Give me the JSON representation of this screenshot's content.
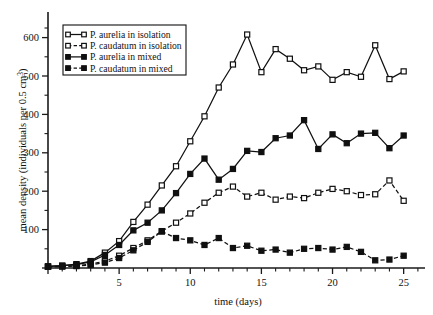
{
  "chart_data": {
    "type": "line",
    "title": "",
    "xlabel": "time (days)",
    "ylabel": "mean density (individuals per 0.5 cm",
    "ylabel_exponent": "3",
    "ylabel_suffix": ")",
    "xlim": [
      0,
      26.5
    ],
    "ylim": [
      0,
      625
    ],
    "grid": false,
    "legend_position": "upper-left",
    "xticks": [
      0,
      5,
      10,
      15,
      20,
      25
    ],
    "xtick_labels": [
      "",
      "5",
      "10",
      "15",
      "20",
      "25"
    ],
    "xticks_minor": [
      1,
      2,
      3,
      4,
      6,
      7,
      8,
      9,
      11,
      12,
      13,
      14,
      16,
      17,
      18,
      19,
      21,
      22,
      23,
      24,
      26
    ],
    "yticks": [
      0,
      100,
      200,
      300,
      400,
      500,
      600
    ],
    "ytick_labels": [
      "",
      "100",
      "200",
      "300",
      "400",
      "500",
      "600"
    ],
    "yticks_minor": [
      50,
      150,
      250,
      350,
      450,
      550,
      625
    ],
    "x": [
      0,
      1,
      2,
      3,
      4,
      5,
      6,
      7,
      8,
      9,
      10,
      11,
      12,
      13,
      14,
      15,
      16,
      17,
      18,
      19,
      20,
      21,
      22,
      23,
      24,
      25
    ],
    "series": [
      {
        "name": "P. aurelia in isolation",
        "marker": "open-square",
        "linestyle": "solid",
        "color": "#101010",
        "values": [
          4,
          6,
          10,
          18,
          40,
          70,
          120,
          165,
          215,
          265,
          330,
          395,
          470,
          530,
          608,
          510,
          570,
          545,
          515,
          525,
          490,
          510,
          498,
          580,
          492,
          512
        ]
      },
      {
        "name": "P. caudatum in isolation",
        "marker": "open-square",
        "linestyle": "dashed",
        "color": "#101010",
        "values": [
          3,
          4,
          6,
          10,
          18,
          32,
          52,
          72,
          96,
          118,
          142,
          170,
          196,
          212,
          186,
          196,
          178,
          186,
          182,
          196,
          206,
          200,
          190,
          192,
          228,
          175
        ]
      },
      {
        "name": "P. aurelia in mixed",
        "marker": "filled-square",
        "linestyle": "solid",
        "color": "#101010",
        "values": [
          4,
          6,
          9,
          16,
          34,
          60,
          98,
          118,
          150,
          195,
          245,
          285,
          230,
          258,
          305,
          302,
          338,
          345,
          385,
          310,
          348,
          325,
          350,
          352,
          312,
          345
        ]
      },
      {
        "name": "P. caudatum in mixed",
        "marker": "filled-square",
        "linestyle": "dashed",
        "color": "#101010",
        "values": [
          3,
          4,
          5,
          8,
          14,
          26,
          46,
          68,
          95,
          78,
          72,
          60,
          78,
          52,
          58,
          45,
          48,
          40,
          50,
          52,
          48,
          55,
          42,
          20,
          22,
          32
        ]
      }
    ]
  }
}
